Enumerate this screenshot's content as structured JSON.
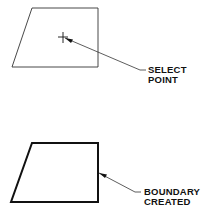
{
  "diagram": {
    "step1": {
      "label_line1": "SELECT",
      "label_line2": "POINT",
      "shape": "quadrilateral",
      "marker": "pick-point cursor"
    },
    "step2": {
      "label_line1": "BOUNDARY",
      "label_line2": "CREATED",
      "shape": "quadrilateral (bold boundary)"
    },
    "colors": {
      "line": "#111111",
      "background": "#ffffff"
    }
  }
}
